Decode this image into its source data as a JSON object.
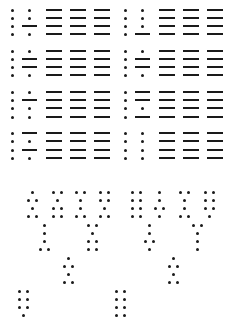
{
  "colors": {
    "ink": "#1a1a1a",
    "background": "#ffffff"
  },
  "glyph_rows": [
    {
      "y": [
        10,
        18,
        26,
        34
      ],
      "groups": [
        {
          "x0": 12,
          "cell": [
            "..",
            "..",
            ".-",
            ".."
          ]
        },
        {
          "x0": 125,
          "cell": [
            "..",
            "..",
            "..",
            ".-"
          ]
        }
      ]
    },
    {
      "y": [
        51,
        59,
        67,
        75
      ],
      "groups": [
        {
          "x0": 12,
          "cell": [
            "..",
            ".-",
            ".-",
            ".."
          ]
        },
        {
          "x0": 125,
          "cell": [
            "..",
            ".-",
            ".-",
            ".."
          ]
        }
      ]
    },
    {
      "y": [
        92,
        100,
        108,
        117
      ],
      "groups": [
        {
          "x0": 12,
          "cell": [
            "..",
            ".-",
            "..",
            ".."
          ]
        },
        {
          "x0": 125,
          "cell": [
            ".-",
            ".-",
            "..",
            ".-"
          ]
        }
      ]
    },
    {
      "y": [
        133,
        141,
        150,
        158
      ],
      "groups": [
        {
          "x0": 12,
          "cell": [
            ".-",
            "..",
            ".-",
            ".."
          ]
        },
        {
          "x0": 125,
          "cell": [
            "..",
            "..",
            "..",
            ".."
          ]
        }
      ]
    }
  ],
  "line_columns_offsets": [
    34,
    58,
    82
  ],
  "line_length": 16,
  "braille_cells": [
    {
      "x": 28,
      "y": 192,
      "rows": [
        "c",
        "b",
        "c",
        "b"
      ]
    },
    {
      "x": 53,
      "y": 192,
      "rows": [
        "b",
        "c",
        "b",
        "b"
      ]
    },
    {
      "x": 76,
      "y": 192,
      "rows": [
        "b",
        "c",
        "c",
        "b"
      ]
    },
    {
      "x": 100,
      "y": 192,
      "rows": [
        "b",
        "b",
        "c",
        "b"
      ]
    },
    {
      "x": 132,
      "y": 192,
      "rows": [
        "b",
        "b",
        "b",
        "b"
      ]
    },
    {
      "x": 155,
      "y": 192,
      "rows": [
        "c",
        "c",
        "b",
        "c"
      ]
    },
    {
      "x": 180,
      "y": 192,
      "rows": [
        "b",
        "c",
        "c",
        "b"
      ]
    },
    {
      "x": 205,
      "y": 192,
      "rows": [
        "b",
        "b",
        "b",
        "c"
      ]
    },
    {
      "x": 40,
      "y": 225,
      "rows": [
        "c",
        "c",
        "c",
        "b"
      ]
    },
    {
      "x": 88,
      "y": 225,
      "rows": [
        "b",
        "c",
        "b",
        "b"
      ]
    },
    {
      "x": 145,
      "y": 225,
      "rows": [
        "c",
        "c",
        "b",
        "c"
      ]
    },
    {
      "x": 193,
      "y": 225,
      "rows": [
        "b",
        "c",
        "c",
        "c"
      ]
    },
    {
      "x": 64,
      "y": 258,
      "rows": [
        "c",
        "b",
        "c",
        "b"
      ]
    },
    {
      "x": 169,
      "y": 258,
      "rows": [
        "c",
        "b",
        "c",
        "b"
      ]
    },
    {
      "x": 19,
      "y": 291,
      "rows": [
        "b",
        "b",
        "b",
        "c"
      ]
    },
    {
      "x": 116,
      "y": 291,
      "rows": [
        "b",
        "b",
        "b",
        "b"
      ]
    }
  ]
}
